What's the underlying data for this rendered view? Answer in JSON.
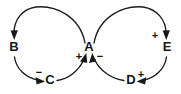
{
  "figure": {
    "type": "causal-loop-diagram",
    "background_color": "#ffffff",
    "stroke_color": "#191919",
    "text_color": "#151515"
  },
  "nodes": [
    {
      "id": "A",
      "label": "A",
      "x": 89,
      "y": 48
    },
    {
      "id": "B",
      "label": "B",
      "x": 14,
      "y": 48
    },
    {
      "id": "C",
      "label": "C",
      "x": 50,
      "y": 81
    },
    {
      "id": "D",
      "label": "D",
      "x": 131,
      "y": 81
    },
    {
      "id": "E",
      "label": "E",
      "x": 167,
      "y": 48
    }
  ],
  "signs": [
    {
      "id": "sign-c-to-a",
      "label": "+",
      "x": 79,
      "y": 57,
      "edge": "C-to-A"
    },
    {
      "id": "sign-d-to-a",
      "label": "−",
      "x": 100,
      "y": 57,
      "edge": "D-to-A"
    },
    {
      "id": "sign-b-to-c",
      "label": "−",
      "x": 39,
      "y": 73,
      "edge": "B-to-C"
    },
    {
      "id": "sign-a-to-e",
      "label": "+",
      "x": 155,
      "y": 36,
      "edge": "A-to-E"
    },
    {
      "id": "sign-e-to-d",
      "label": "+",
      "x": 141,
      "y": 75,
      "edge": "E-to-D"
    }
  ],
  "edges": [
    {
      "id": "A-to-B",
      "from": "A",
      "to": "B",
      "polarity": "",
      "direction": "counterclockwise-top-left"
    },
    {
      "id": "B-to-C",
      "from": "B",
      "to": "C",
      "polarity": "−",
      "direction": "down-left-arc"
    },
    {
      "id": "C-to-A",
      "from": "C",
      "to": "A",
      "polarity": "+",
      "direction": "up-right-arc"
    },
    {
      "id": "A-to-E",
      "from": "A",
      "to": "E",
      "polarity": "+",
      "direction": "clockwise-top-right"
    },
    {
      "id": "E-to-D",
      "from": "E",
      "to": "D",
      "polarity": "+",
      "direction": "down-left-arc"
    },
    {
      "id": "D-to-A",
      "from": "D",
      "to": "A",
      "polarity": "−",
      "direction": "up-left-arc"
    }
  ],
  "loops": [
    {
      "id": "left-loop",
      "members": [
        "A",
        "B",
        "C"
      ]
    },
    {
      "id": "right-loop",
      "members": [
        "A",
        "E",
        "D"
      ]
    }
  ]
}
